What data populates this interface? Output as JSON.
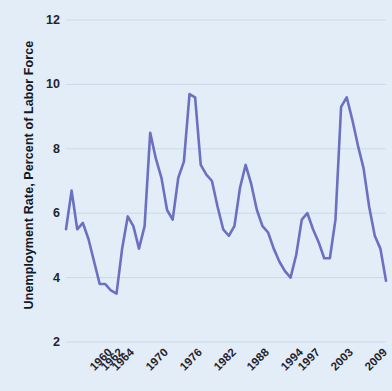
{
  "chart_data": {
    "type": "line",
    "title": "",
    "xlabel": "",
    "ylabel": "Unemployment Rate, Percent of Labor Force",
    "ylim": [
      2,
      12
    ],
    "yticks": [
      2,
      4,
      6,
      8,
      10,
      12
    ],
    "xlim": [
      1960,
      2017
    ],
    "xtick_labels": [
      "1960",
      "1962",
      "1964",
      "1970",
      "1976",
      "1982",
      "1988",
      "1994",
      "1997",
      "2003",
      "2009",
      "2015",
      "2017"
    ],
    "xticks": [
      1960,
      1962,
      1964,
      1970,
      1976,
      1982,
      1988,
      1994,
      1997,
      2003,
      2009,
      2015,
      2017
    ],
    "grid": true,
    "legend": false,
    "legend_position": "none",
    "line_color": "#6b70c0",
    "background_color": "#e3edf7",
    "gridline_color": "#c9d9ea",
    "series": [
      {
        "name": "Unemployment Rate",
        "x": [
          1960,
          1961,
          1962,
          1963,
          1964,
          1965,
          1966,
          1967,
          1968,
          1969,
          1970,
          1971,
          1972,
          1973,
          1974,
          1975,
          1976,
          1977,
          1978,
          1979,
          1980,
          1981,
          1982,
          1983,
          1984,
          1985,
          1986,
          1987,
          1988,
          1989,
          1990,
          1991,
          1992,
          1993,
          1994,
          1995,
          1996,
          1997,
          1998,
          1999,
          2000,
          2001,
          2002,
          2003,
          2004,
          2005,
          2006,
          2007,
          2008,
          2009,
          2010,
          2011,
          2012,
          2013,
          2014,
          2015,
          2016,
          2017
        ],
        "values": [
          5.5,
          6.7,
          5.5,
          5.7,
          5.2,
          4.5,
          3.8,
          3.8,
          3.6,
          3.5,
          4.9,
          5.9,
          5.6,
          4.9,
          5.6,
          8.5,
          7.7,
          7.1,
          6.1,
          5.8,
          7.1,
          7.6,
          9.7,
          9.6,
          7.5,
          7.2,
          7.0,
          6.2,
          5.5,
          5.3,
          5.6,
          6.8,
          7.5,
          6.9,
          6.1,
          5.6,
          5.4,
          4.9,
          4.5,
          4.2,
          4.0,
          4.7,
          5.8,
          6.0,
          5.5,
          5.1,
          4.6,
          4.6,
          5.8,
          9.3,
          9.6,
          8.9,
          8.1,
          7.4,
          6.2,
          5.3,
          4.9,
          3.9
        ]
      }
    ],
    "plotted_vertices": [
      {
        "label": "1960",
        "value": 5.5
      },
      {
        "label": "1961",
        "value": 6.7
      },
      {
        "label": "1962",
        "value": 5.5
      },
      {
        "label": "1963",
        "value": 5.6
      },
      {
        "label": "1964",
        "value": 5.5
      },
      {
        "label": "1968",
        "value": 4.6
      },
      {
        "label": "1969",
        "value": 3.8
      },
      {
        "label": "1970",
        "value": 4.9
      },
      {
        "label": "1971",
        "value": 4.9
      },
      {
        "label": "1973",
        "value": 5.6
      },
      {
        "label": "1975",
        "value": 7.7
      },
      {
        "label": "1977",
        "value": 5.9
      },
      {
        "label": "1979",
        "value": 7.5
      },
      {
        "label": "1982",
        "value": 9.7
      },
      {
        "label": "1985",
        "value": 6.3
      },
      {
        "label": "1988",
        "value": 6.9
      },
      {
        "label": "1992",
        "value": 5.5
      },
      {
        "label": "1995",
        "value": 6.1
      },
      {
        "label": "1999",
        "value": 4.6
      },
      {
        "label": "2000",
        "value": 4.0
      },
      {
        "label": "2003",
        "value": 6.0
      },
      {
        "label": "2006",
        "value": 4.6
      },
      {
        "label": "2009",
        "value": 9.3
      },
      {
        "label": "2012",
        "value": 8.2
      },
      {
        "label": "2015",
        "value": 5.3
      },
      {
        "label": "2017",
        "value": 3.9
      }
    ]
  }
}
